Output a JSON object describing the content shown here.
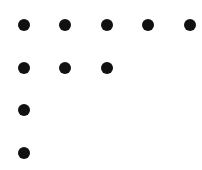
{
  "figure": {
    "dot_color": "#111111",
    "dot_diameter": 12,
    "rows": [
      {
        "count": 5,
        "y": 24.5,
        "x": [
          23.5,
          65,
          106.5,
          148,
          189.5
        ]
      },
      {
        "count": 3,
        "y": 68,
        "x": [
          23.5,
          65,
          106.5
        ]
      },
      {
        "count": 1,
        "y": 110,
        "x": [
          23.5
        ]
      },
      {
        "count": 1,
        "y": 152.5,
        "x": [
          23.5
        ]
      }
    ],
    "total_dots": 10
  }
}
